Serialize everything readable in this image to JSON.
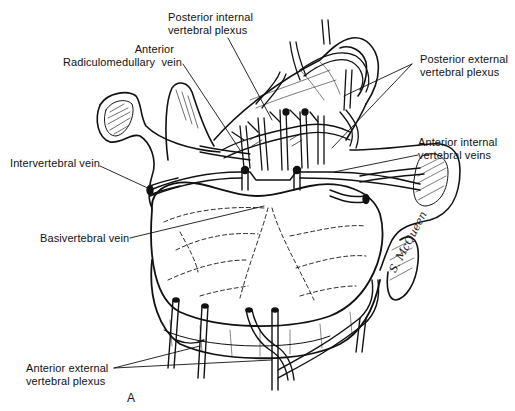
{
  "figure": {
    "panel_letter": "A",
    "signature": "S. McQueen",
    "ink_color": "#111111",
    "background_color": "#ffffff"
  },
  "labels": {
    "posterior_internal": {
      "line1": "Posterior internal",
      "line2": "vertebral plexus"
    },
    "anterior_radiculomedullary": {
      "line1": "Anterior",
      "line2": "Radiculomedullary  vein"
    },
    "posterior_external": {
      "line1": "Posterior external",
      "line2": "vertebral plexus"
    },
    "anterior_internal": {
      "line1": "Anterior internal",
      "line2": "vertebral veins"
    },
    "intervertebral": {
      "line1": "Intervertebral vein"
    },
    "basivertebral": {
      "line1": "Basivertebral vein"
    },
    "anterior_external": {
      "line1": "Anterior external",
      "line2": "vertebral plexus"
    }
  }
}
